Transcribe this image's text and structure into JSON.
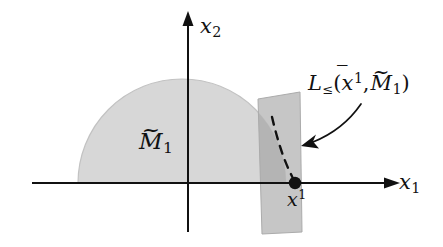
{
  "figure": {
    "type": "mathematical-diagram",
    "background_color": "#ffffff",
    "ink_color": "#111111"
  },
  "axes": {
    "horizontal": {
      "label_base": "x",
      "label_subscript": "1",
      "arrow": "right"
    },
    "vertical": {
      "label_base": "x",
      "label_subscript": "2",
      "arrow": "up"
    },
    "origin": {
      "x": 188,
      "y": 183
    }
  },
  "regions": {
    "half_disc": {
      "label_base": "M",
      "label_accent": "~",
      "label_subscript": "1",
      "fill_color": "#d6d6d6",
      "shape": "half-disc above the horizontal axis"
    },
    "strip": {
      "fill_color": "#bdbdbd",
      "shape": "near-vertical slanted band crossing the horizontal axis"
    }
  },
  "point": {
    "label_base": "x",
    "label_accent": "bar",
    "label_superscript": "1",
    "marker": "filled-dot",
    "color": "#111111",
    "position": {
      "x": 295,
      "y": 183
    }
  },
  "sublevel_set": {
    "name_base": "L",
    "name_subscript": "≤",
    "open_paren": "(",
    "arg1_base": "x",
    "arg1_accent": "bar",
    "arg1_superscript": "1",
    "comma": ",",
    "arg2_base": "M",
    "arg2_accent": "~",
    "arg2_subscript": "1",
    "close_paren": ")",
    "boundary_style": "dashed",
    "boundary_color": "#111111"
  },
  "annotations": {
    "callout_arrow": {
      "from": {
        "x": 360,
        "y": 106
      },
      "to": {
        "x": 303,
        "y": 146
      },
      "style": "curved-arrow"
    }
  }
}
